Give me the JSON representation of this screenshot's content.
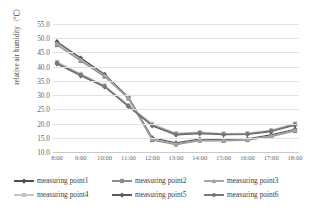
{
  "chart_data": {
    "type": "line",
    "title": "",
    "xlabel": "",
    "ylabel": "relative air humidity（℃）",
    "categories": [
      "8:00",
      "9:00",
      "10:00",
      "11:00",
      "12:00",
      "13:00",
      "14:00",
      "15:00",
      "16:00",
      "17:00",
      "18:00"
    ],
    "ylim": [
      10.0,
      55.0
    ],
    "yticks": [
      "10.0",
      "15.0",
      "20.0",
      "25.0",
      "30.0",
      "35.0",
      "40.0",
      "45.0",
      "50.0",
      "55.0"
    ],
    "ytick_values": [
      10.0,
      15.0,
      20.0,
      25.0,
      30.0,
      35.0,
      40.0,
      45.0,
      50.0,
      55.0
    ],
    "grid": true,
    "legend_position": "bottom",
    "series": [
      {
        "name": "measuring point1",
        "color": "#4d4d4d",
        "marker": "diamond",
        "values": [
          48.8,
          43.0,
          37.3,
          29.3,
          15.0,
          13.2,
          14.5,
          14.3,
          14.6,
          16.0,
          18.0
        ]
      },
      {
        "name": "measuring point2",
        "color": "#8c8c8c",
        "marker": "square",
        "values": [
          47.6,
          42.0,
          36.5,
          28.8,
          14.2,
          12.6,
          14.0,
          13.9,
          14.2,
          15.4,
          17.4
        ]
      },
      {
        "name": "measuring point3",
        "color": "#a6a6a6",
        "marker": "triangle",
        "values": [
          48.2,
          42.5,
          36.9,
          29.0,
          14.6,
          12.9,
          14.2,
          14.1,
          14.4,
          15.7,
          17.7
        ]
      },
      {
        "name": "measuring point4",
        "color": "#c4c4c4",
        "marker": "square",
        "values": [
          41.7,
          37.5,
          33.4,
          26.5,
          19.9,
          16.6,
          17.0,
          16.5,
          16.6,
          17.7,
          20.0
        ]
      },
      {
        "name": "measuring point5",
        "color": "#5a5a5a",
        "marker": "diamond",
        "values": [
          41.0,
          36.8,
          32.9,
          26.0,
          19.2,
          16.0,
          16.5,
          16.1,
          16.2,
          17.2,
          19.4
        ]
      },
      {
        "name": "measuring point6",
        "color": "#787878",
        "marker": "circle",
        "values": [
          41.3,
          37.1,
          33.1,
          26.2,
          19.5,
          16.3,
          16.7,
          16.3,
          16.4,
          17.4,
          19.7
        ]
      }
    ]
  },
  "legend": {
    "items": [
      {
        "label": "measuring point1"
      },
      {
        "label": "measuring point2"
      },
      {
        "label": "measuring point3"
      },
      {
        "label": "measuring point4"
      },
      {
        "label": "measuring point5"
      },
      {
        "label": "measuring point6"
      }
    ]
  }
}
